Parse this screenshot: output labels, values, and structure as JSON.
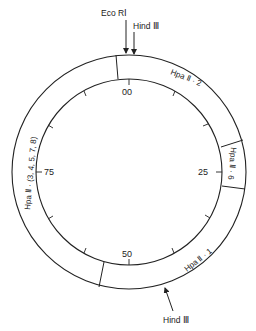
{
  "diagram": {
    "type": "circular restriction map",
    "colors": {
      "line": "#222222",
      "background": "#ffffff"
    },
    "geometry": {
      "cx": 129,
      "cy": 172,
      "outer_r": 117,
      "inner_r": 93
    },
    "sites": {
      "eco_ri": {
        "label": "Eco RⅠ"
      },
      "hind_iii_top": {
        "label": "Hind Ⅲ"
      },
      "hind_iii_bottom": {
        "label": "Hind Ⅲ"
      }
    },
    "scale_labels": {
      "s00": "00",
      "s25": "25",
      "s50": "50",
      "s75": "75"
    },
    "fragments": [
      {
        "id": "hpa2-2",
        "label": "Hpa Ⅱ · 2"
      },
      {
        "id": "hpa2-6",
        "label": "Hpa Ⅱ · 6"
      },
      {
        "id": "hpa2-1",
        "label": "Hpa Ⅱ · 1"
      },
      {
        "id": "hpa2-rest",
        "label": "Hpa Ⅱ · (3, 4, 5, 7, 8)"
      }
    ]
  }
}
